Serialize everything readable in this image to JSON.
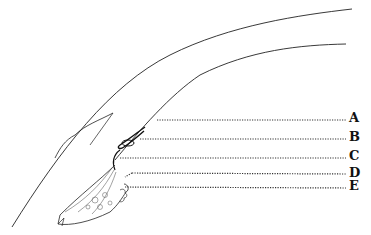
{
  "diagram": {
    "labels": [
      {
        "id": "A",
        "text": "A",
        "x": 349,
        "y": 112,
        "line_y": 120,
        "line_x1": 157
      },
      {
        "id": "B",
        "text": "B",
        "x": 349,
        "y": 131,
        "line_y": 139,
        "line_x1": 140
      },
      {
        "id": "C",
        "text": "C",
        "x": 349,
        "y": 150,
        "line_y": 158,
        "line_x1": 120
      },
      {
        "id": "D",
        "text": "D",
        "x": 349,
        "y": 167,
        "line_y": 173,
        "line_x1": 132
      },
      {
        "id": "E",
        "text": "E",
        "x": 349,
        "y": 180,
        "line_y": 187,
        "line_x1": 125
      }
    ],
    "line_color": "#222222",
    "dot_color": "#333333"
  }
}
